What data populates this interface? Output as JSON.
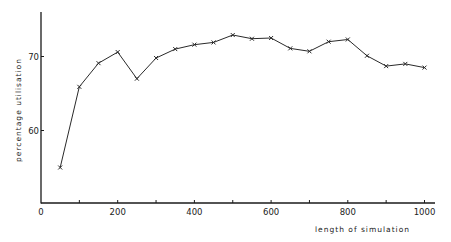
{
  "chart_data": {
    "type": "line",
    "title": "",
    "xlabel": "length of simulation",
    "ylabel": "percentage utilisation",
    "xlim": [
      0,
      1030
    ],
    "ylim": [
      50,
      76
    ],
    "grid": false,
    "legend": null,
    "marker": "x",
    "x_ticks": [
      0,
      200,
      400,
      600,
      800,
      1000
    ],
    "x_minor_ticks": [
      100,
      300,
      500,
      700,
      900
    ],
    "y_ticks": [
      60,
      70
    ],
    "x_tick_labels": [
      "0",
      "200",
      "400",
      "600",
      "800",
      "1000"
    ],
    "y_tick_labels": [
      "60",
      "70"
    ],
    "x": [
      50,
      100,
      150,
      200,
      250,
      300,
      350,
      400,
      450,
      500,
      550,
      600,
      650,
      700,
      750,
      800,
      850,
      900,
      950,
      1000
    ],
    "series": [
      {
        "name": "percentage utilisation",
        "values": [
          55.0,
          65.9,
          69.1,
          70.6,
          67.0,
          69.8,
          71.0,
          71.6,
          71.9,
          72.9,
          72.4,
          72.5,
          71.1,
          70.7,
          72.0,
          72.3,
          70.1,
          68.7,
          69.0,
          68.5
        ]
      }
    ]
  },
  "colors": {
    "line": "#2a2a2a",
    "axis": "#1a1a1a",
    "background": "#ffffff"
  }
}
